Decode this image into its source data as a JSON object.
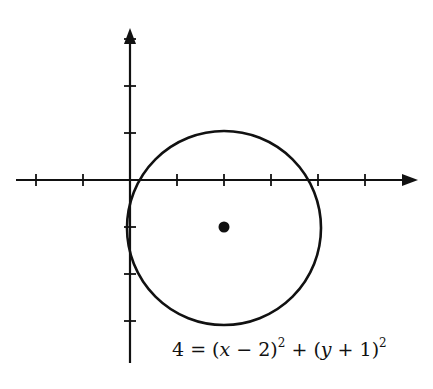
{
  "figure": {
    "type": "coordinate-plane-circle",
    "background": "#ffffff",
    "stroke_color": "#111111",
    "axes": {
      "origin_px": [
        130,
        180
      ],
      "unit_px": 47,
      "x_axis": {
        "from_px": 16,
        "to_px": 418,
        "arrow": "right",
        "ticks": [
          -2,
          -1,
          1,
          2,
          3,
          4,
          5
        ]
      },
      "y_axis": {
        "from_px": 363,
        "to_px": 28,
        "arrow": "up",
        "ticks": [
          3,
          2,
          1,
          -1,
          -2,
          -3
        ]
      }
    },
    "circle": {
      "center": [
        2,
        -1
      ],
      "radius": 2
    },
    "center_point": {
      "x": 2,
      "y": -1
    }
  },
  "equation": {
    "lhs": "4",
    "eq": "=",
    "term1_open": "(",
    "term1_var": "x",
    "term1_op": " − 2)",
    "term1_exp": "2",
    "plus": " + ",
    "term2_open": "(",
    "term2_var": "y",
    "term2_op": " + 1)",
    "term2_exp": "2"
  }
}
